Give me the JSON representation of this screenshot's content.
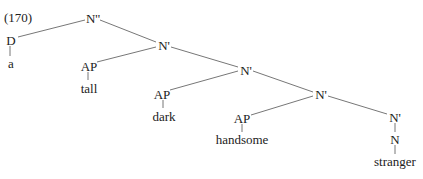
{
  "example_number": "(170)",
  "nodes": {
    "root": "N''",
    "det": "D",
    "det_word": "a",
    "nbar1": "N'",
    "ap1": "AP",
    "ap1_word": "tall",
    "nbar2": "N'",
    "ap2": "AP",
    "ap2_word": "dark",
    "nbar3": "N'",
    "ap3": "AP",
    "ap3_word": "handsome",
    "nbar4": "N'",
    "n": "N",
    "n_word": "stranger"
  },
  "colors": {
    "line": "#777777",
    "text": "#222222"
  }
}
